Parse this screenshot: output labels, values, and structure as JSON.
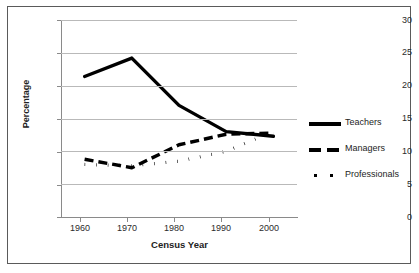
{
  "chart_data": {
    "type": "line",
    "title": "",
    "xlabel": "Census Year",
    "ylabel": "Percentage",
    "x": [
      1960,
      1970,
      1980,
      1990,
      2000
    ],
    "categories": [
      "1960",
      "1970",
      "1980",
      "1990",
      "2000"
    ],
    "xlim": [
      1955,
      2005
    ],
    "ylim": [
      0,
      30
    ],
    "yticks": [
      0,
      5,
      10,
      15,
      20,
      25,
      30
    ],
    "ytick_labels": [
      "0",
      "5",
      "10",
      "15",
      "20",
      "25",
      "30"
    ],
    "xticks": [
      1960,
      1970,
      1980,
      1990,
      2000
    ],
    "xtick_labels": [
      "1960",
      "1970",
      "1980",
      "1990",
      "2000"
    ],
    "grid": "horizontal",
    "legend_position": "right",
    "series": [
      {
        "name": "Teachers",
        "style": "solid",
        "color": "#000000",
        "values": [
          21.4,
          24.2,
          17.0,
          13.0,
          12.3
        ]
      },
      {
        "name": "Managers",
        "style": "dashed",
        "color": "#000000",
        "values": [
          8.8,
          7.5,
          11.0,
          12.6,
          12.8
        ]
      },
      {
        "name": "Professionals",
        "style": "dotted",
        "color": "#000000",
        "values": [
          8.0,
          7.8,
          8.5,
          10.0,
          13.0
        ]
      }
    ]
  },
  "legend": {
    "items": [
      {
        "label": "Teachers",
        "style": "solid"
      },
      {
        "label": "Managers",
        "style": "dashed"
      },
      {
        "label": "Professionals",
        "style": "dotted"
      }
    ]
  },
  "axes": {
    "y_title": "Percentage",
    "x_title": "Census Year"
  }
}
